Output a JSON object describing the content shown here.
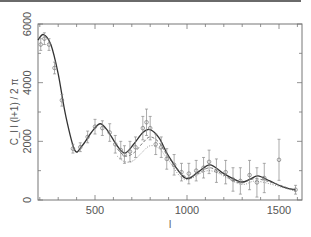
{
  "chart_data": {
    "type": "line",
    "title": "",
    "xlabel": "l",
    "ylabel": "C_l l (l+1) / 2 π",
    "xlim": [
      190,
      1625
    ],
    "ylim": [
      0,
      6000
    ],
    "x_ticks": [
      500,
      1000,
      1500
    ],
    "x_tick_labels": [
      "500",
      "1000",
      "1500"
    ],
    "y_ticks": [
      0,
      2000,
      4000,
      6000
    ],
    "y_tick_labels": [
      "0",
      "2000",
      "4000",
      "6000"
    ],
    "grid": false,
    "legend": null,
    "series": [
      {
        "name": "model (solid)",
        "style": "solid",
        "x": [
          190,
          220,
          260,
          300,
          340,
          390,
          430,
          480,
          527,
          570,
          620,
          663,
          710,
          760,
          800,
          850,
          900,
          990,
          1060,
          1125,
          1200,
          1290,
          1340,
          1385,
          1450,
          1520,
          1590
        ],
        "y": [
          5450,
          5640,
          5300,
          4300,
          2900,
          1700,
          1850,
          2300,
          2600,
          2350,
          1850,
          1600,
          1900,
          2300,
          2400,
          2100,
          1500,
          750,
          950,
          1200,
          900,
          620,
          700,
          820,
          650,
          450,
          340
        ]
      },
      {
        "name": "model (dashed)",
        "style": "dashed",
        "x": [
          620,
          663,
          710,
          760,
          800,
          850,
          900,
          990,
          1060,
          1125,
          1200,
          1290,
          1385,
          1590
        ],
        "y": [
          1750,
          1500,
          1600,
          1950,
          2150,
          1950,
          1450,
          800,
          900,
          1100,
          850,
          580,
          720,
          320
        ]
      },
      {
        "name": "model (dotted)",
        "style": "dotted",
        "x": [
          620,
          663,
          710,
          760,
          800,
          850,
          900,
          990,
          1125,
          1290,
          1385,
          1590
        ],
        "y": [
          1500,
          1300,
          1350,
          1650,
          1850,
          1750,
          1350,
          700,
          1000,
          540,
          640,
          300
        ]
      },
      {
        "name": "data points",
        "style": "points-with-errorbars",
        "x": [
          205,
          225,
          250,
          280,
          320,
          380,
          420,
          460,
          500,
          540,
          580,
          610,
          640,
          660,
          690,
          720,
          760,
          780,
          800,
          830,
          860,
          890,
          930,
          970,
          1010,
          1050,
          1090,
          1120,
          1160,
          1210,
          1250,
          1290,
          1340,
          1380,
          1420,
          1500,
          1590
        ],
        "y": [
          5300,
          5500,
          5300,
          4500,
          3400,
          1750,
          1800,
          2150,
          2500,
          2450,
          2300,
          1900,
          1700,
          1550,
          1650,
          1800,
          2450,
          2650,
          2450,
          1900,
          1800,
          1400,
          1200,
          950,
          900,
          1000,
          1100,
          1300,
          1000,
          950,
          700,
          650,
          850,
          600,
          750,
          1370,
          350
        ],
        "err": [
          200,
          200,
          200,
          200,
          200,
          150,
          150,
          200,
          250,
          250,
          300,
          300,
          300,
          300,
          350,
          350,
          400,
          450,
          400,
          350,
          350,
          350,
          350,
          300,
          350,
          350,
          350,
          400,
          400,
          400,
          400,
          450,
          500,
          500,
          500,
          700,
          150
        ]
      }
    ]
  }
}
